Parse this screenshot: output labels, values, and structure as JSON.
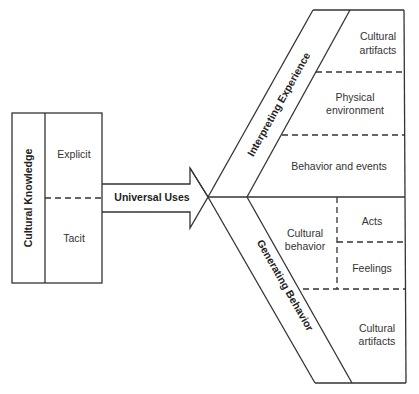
{
  "diagram": {
    "left_box": {
      "title": "Cultural Knowledge",
      "sections": [
        {
          "label": "Explicit"
        },
        {
          "label": "Tacit"
        }
      ]
    },
    "arrow": {
      "label": "Universal Uses"
    },
    "upper_branch": {
      "title": "Interpreting Experience",
      "cells": [
        {
          "line1": "Cultural",
          "line2": "artifacts"
        },
        {
          "line1": "Physical",
          "line2": "environment"
        },
        {
          "line1": "Behavior and events"
        }
      ]
    },
    "lower_branch": {
      "title": "Generating Behavior",
      "cultural_behavior": {
        "line1": "Cultural",
        "line2": "behavior"
      },
      "sub_cells": [
        {
          "label": "Acts"
        },
        {
          "label": "Feelings"
        }
      ],
      "bottom_cell": {
        "line1": "Cultural",
        "line2": "artifacts"
      }
    },
    "colors": {
      "line": "#333333",
      "text": "#333333",
      "background": "#ffffff"
    }
  }
}
